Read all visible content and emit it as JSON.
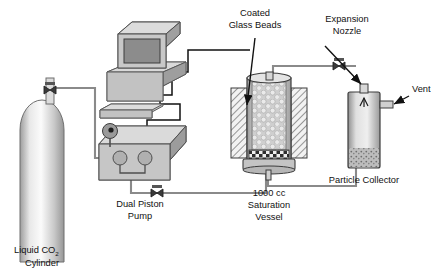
{
  "figure": {
    "type": "process-flow-diagram",
    "background_color": "#ffffff",
    "line_color_process": "#8a8a8a",
    "line_color_signal": "#111111",
    "fill_light": "#d8d8d8",
    "fill_mid": "#b4b4b4",
    "fill_dark": "#8e8e8e"
  },
  "labels": {
    "cylinder_line1": "Liquid CO",
    "cylinder_sub": "2",
    "cylinder_line2": "Cylinder",
    "pump_line1": "Dual Piston",
    "pump_line2": "Pump",
    "beads_line1": "Coated",
    "beads_line2": "Glass Beads",
    "nozzle_line1": "Expansion",
    "nozzle_line2": "Nozzle",
    "vent": "Vent",
    "vessel_line1": "1000 cc",
    "vessel_line2": "Saturation",
    "vessel_line3": "Vessel",
    "collector": "Particle Collector"
  },
  "components": [
    {
      "id": "liquid-co2-cylinder",
      "name": "Liquid CO2 Cylinder"
    },
    {
      "id": "computer-workstation",
      "name": "Computer Workstation"
    },
    {
      "id": "keyboard",
      "name": "Keyboard"
    },
    {
      "id": "dual-piston-pump",
      "name": "Dual Piston Pump"
    },
    {
      "id": "saturation-vessel",
      "name": "1000 cc Saturation Vessel"
    },
    {
      "id": "coated-glass-beads",
      "name": "Coated Glass Beads"
    },
    {
      "id": "expansion-nozzle",
      "name": "Expansion Nozzle"
    },
    {
      "id": "particle-collector",
      "name": "Particle Collector"
    },
    {
      "id": "vent-port",
      "name": "Vent"
    }
  ],
  "valves": [
    {
      "id": "cylinder-outlet-valve",
      "x": 50,
      "y": 93
    },
    {
      "id": "pump-outlet-valve",
      "x": 157,
      "y": 193
    },
    {
      "id": "nozzle-inlet-valve",
      "x": 339,
      "y": 66
    }
  ]
}
